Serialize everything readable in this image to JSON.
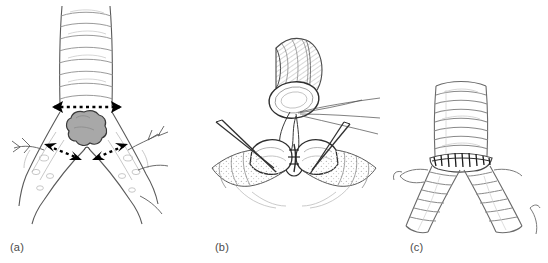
{
  "figure": {
    "background_color": "#ffffff",
    "width": 548,
    "height": 263,
    "style": "medical line drawing / surgical illustration"
  },
  "panels": [
    {
      "id": "a",
      "label": "(a)",
      "title": "Tumor at the carina with planned resection lines",
      "structures": {
        "trachea": "vertical tube with cartilage rings",
        "tumor": "lobulated gray mass at the carina",
        "left_main_bronchus": "descends to lower left",
        "right_main_bronchus": "descends to lower right"
      },
      "annotations": {
        "resection_lines": 3,
        "line_style": "dashed",
        "arrowheads": "solid black double-headed",
        "tracheal_line": "horizontal dashed line across trachea above tumor",
        "bronchial_lines": "two angled dashed lines across each main bronchus"
      },
      "colors": {
        "outline": "#1a1a1a",
        "tumor_fill": "#a8a8a8",
        "tumor_outline": "#3a3a3a",
        "detail_line": "#9a9a9a"
      }
    },
    {
      "id": "b",
      "label": "(b)",
      "title": "Anastomosis of tracheal stump to joined bronchial stumps",
      "structures": {
        "tracheal_stump": "tilted open stump with oval lumen, upper center",
        "left_bronchial_stump": "open stump lower left",
        "right_bronchial_stump": "open stump lower right",
        "neo_carina": "bronchial stumps sutured together in midline"
      },
      "annotations": {
        "sutures": "fine threads from tracheal stump drawn to the right",
        "suture_loop": "loop of suture between trachea and neo-carina",
        "instruments": "two pairs of fine needle/retractor tips flanking the field"
      },
      "colors": {
        "outline": "#2a2a2a",
        "shading": "#b4b4b4",
        "instrument": "#333333"
      }
    },
    {
      "id": "c",
      "label": "(c)",
      "title": "Completed neo-carina reconstruction",
      "structures": {
        "trachea": "ringed tube descending to anastomosis",
        "anastomosis": "circumferential suture line at the neo-carina",
        "left_main_bronchus": "ringed bronchus to lower left",
        "right_main_bronchus": "ringed bronchus to lower right"
      },
      "annotations": {
        "suture_line": "dark interrupted stitches across the anastomosis",
        "ring_count_trachea": 8
      },
      "colors": {
        "outline": "#6a6a6a",
        "ring": "#8a8a8a",
        "suture": "#1a1a1a"
      }
    }
  ]
}
